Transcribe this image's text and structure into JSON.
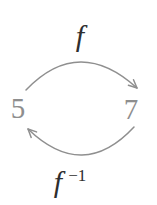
{
  "diagram": {
    "background_color": "#ffffff",
    "arrow_color": "#8f8f8f",
    "number_color": "#8e8e8e",
    "label_color": "#2e2e2e",
    "top_label": {
      "base": "f"
    },
    "bottom_label": {
      "base": "f",
      "superscript": "−1"
    },
    "left_value": "5",
    "right_value": "7"
  }
}
